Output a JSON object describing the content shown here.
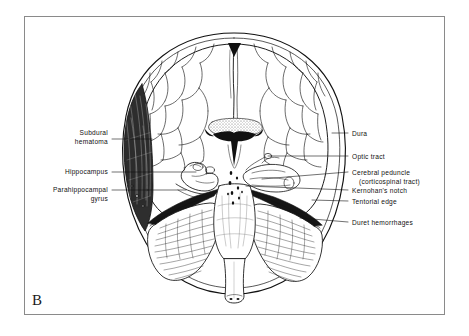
{
  "figure": {
    "panel_letter": "B",
    "background_color": "#ffffff",
    "frame_color": "#8a8a8a",
    "ink_color": "#111111"
  },
  "labels_left": [
    {
      "name": "subdural-hematoma",
      "line1": "Subdural",
      "line2": "hematoma"
    },
    {
      "name": "hippocampus",
      "line1": "Hippocampus",
      "line2": ""
    },
    {
      "name": "parahippocampal-gyrus",
      "line1": "Parahippocampal",
      "line2": "gyrus"
    }
  ],
  "labels_right": [
    {
      "name": "dura",
      "line1": "Dura",
      "line2": ""
    },
    {
      "name": "optic-tract",
      "line1": "Optic tract",
      "line2": ""
    },
    {
      "name": "cerebral-peduncle",
      "line1": "Cerebral peduncle",
      "line2": "(corticospinal tract)"
    },
    {
      "name": "kernohans-notch",
      "line1": "Kernohan's notch",
      "line2": ""
    },
    {
      "name": "tentorial-edge",
      "line1": "Tentorial edge",
      "line2": ""
    },
    {
      "name": "duret-hemorrhages",
      "line1": "Duret hemorrhages",
      "line2": ""
    }
  ],
  "anatomy_parts": [
    "dura-outline",
    "cerebral-hemispheres",
    "cortical-sulci",
    "corpus-callosum",
    "lateral-ventricles",
    "third-ventricle",
    "subdural-hematoma-mass",
    "uncus-herniation",
    "cerebral-peduncle",
    "tentorium",
    "cerebellum",
    "brainstem",
    "medulla",
    "duret-hemorrhage-dots"
  ]
}
